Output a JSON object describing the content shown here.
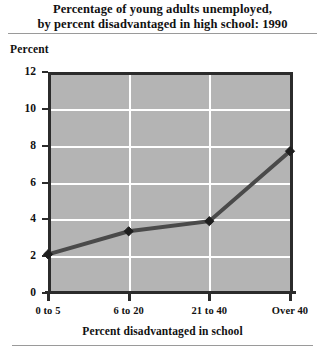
{
  "title": {
    "line1": "Percentage of young adults unemployed,",
    "line2": "by percent disadvantaged in high school: 1990"
  },
  "axis_unit_label": "Percent",
  "chart_data": {
    "type": "line",
    "title": "Percentage of young adults unemployed, by percent disadvantaged in high school: 1990",
    "categories": [
      "0 to 5",
      "6 to 20",
      "21 to 40",
      "Over 40"
    ],
    "values": [
      2.1,
      3.35,
      3.9,
      7.7
    ],
    "xlabel": "Percent disadvantaged in school",
    "ylabel": "Percent",
    "ylim": [
      0,
      12
    ],
    "yticks": [
      "0",
      "2",
      "4",
      "6",
      "8",
      "10",
      "12"
    ],
    "ytick_values": [
      0,
      2,
      4,
      6,
      8,
      10,
      12
    ],
    "grid": "horizontal-and-vertical",
    "legend": "none",
    "marker": "diamond",
    "series_color": "#4a4a4a",
    "plot_background": "#b4b4b4",
    "gridline_color": "#ffffff"
  }
}
